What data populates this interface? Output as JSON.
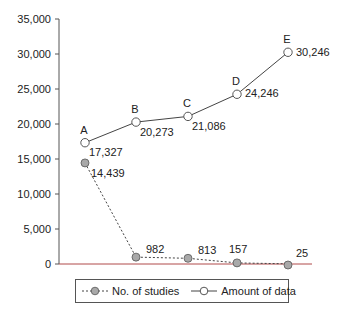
{
  "chart_data": {
    "type": "line",
    "title": "",
    "xlabel": "",
    "ylabel": "",
    "ylim": [
      0,
      35000
    ],
    "yticks": [
      0,
      5000,
      10000,
      15000,
      20000,
      25000,
      30000,
      35000
    ],
    "ytick_labels": [
      "0",
      "5,000",
      "10,000",
      "15,000",
      "20,000",
      "25,000",
      "30,000",
      "35,000"
    ],
    "categories": [
      "A",
      "B",
      "C",
      "D",
      "E"
    ],
    "grid": false,
    "legend_position": "bottom",
    "series": [
      {
        "name": "No. of studies",
        "style": "dashed",
        "marker": "filled-gray-circle",
        "values": [
          14439,
          982,
          813,
          157,
          25
        ],
        "labels": [
          "14,439",
          "982",
          "813",
          "157",
          "25"
        ]
      },
      {
        "name": "Amount of data",
        "style": "solid",
        "marker": "open-circle",
        "values": [
          17327,
          20273,
          21086,
          24246,
          30246
        ],
        "labels": [
          "17,327",
          "20,273",
          "21,086",
          "24,246",
          "30,246"
        ]
      }
    ]
  },
  "legend": {
    "items": [
      {
        "label": "No. of studies"
      },
      {
        "label": "Amount of data"
      }
    ]
  },
  "colors": {
    "axis": "#555555",
    "baseline": "#b04a4a",
    "line": "#444444",
    "filled_marker": "#a9a9a9"
  }
}
